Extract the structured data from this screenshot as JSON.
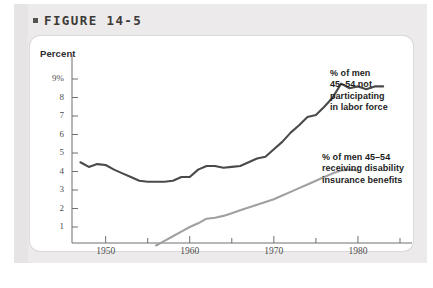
{
  "figure": {
    "bullet": "square-bullet",
    "label": "FIGURE 14-5"
  },
  "chart_data": {
    "type": "line",
    "title": "FIGURE 14-5",
    "xlabel": "",
    "ylabel": "Percent",
    "ylabel_text": "Percent",
    "xlim": [
      1946,
      1985
    ],
    "ylim": [
      0,
      9.6
    ],
    "grid": false,
    "legend_position": "right-inline",
    "y_ticks": [
      1,
      2,
      3,
      4,
      5,
      6,
      7,
      8,
      9
    ],
    "y_tick_labels": [
      "1",
      "2",
      "3",
      "4",
      "5",
      "6",
      "7",
      "8",
      "9%"
    ],
    "x_ticks": [
      1950,
      1960,
      1970,
      1980
    ],
    "x_tick_labels": [
      "1950",
      "1960",
      "1970",
      "1980"
    ],
    "x_minor_ticks": [
      1955,
      1965,
      1975,
      1985
    ],
    "colors": {
      "series1": "#4a4a4a",
      "series2": "#a0a0a0",
      "axis": "#6f6f6f",
      "card": "#ffffff",
      "panel": "#eceaea"
    },
    "series": [
      {
        "name": "% of men 45–54 not participating in labor force",
        "color": "#4a4a4a",
        "label_lines": [
          "% of men",
          "45–54 not",
          "participating",
          "in labor force"
        ],
        "x": [
          1947,
          1948,
          1949,
          1950,
          1951,
          1952,
          1953,
          1954,
          1955,
          1956,
          1957,
          1958,
          1959,
          1960,
          1961,
          1962,
          1963,
          1964,
          1965,
          1966,
          1967,
          1968,
          1969,
          1970,
          1971,
          1972,
          1973,
          1974,
          1975,
          1976,
          1977,
          1978,
          1979,
          1980,
          1981,
          1982,
          1983
        ],
        "values": [
          4.5,
          4.25,
          4.4,
          4.35,
          4.1,
          3.9,
          3.7,
          3.5,
          3.45,
          3.45,
          3.45,
          3.5,
          3.7,
          3.7,
          4.1,
          4.3,
          4.3,
          4.2,
          4.25,
          4.3,
          4.5,
          4.7,
          4.8,
          5.2,
          5.6,
          6.1,
          6.5,
          6.95,
          7.05,
          7.5,
          8.0,
          8.75,
          8.5,
          8.6,
          8.45,
          8.6,
          8.6
        ]
      },
      {
        "name": "% of men 45–54 receiving disability insurance benefits",
        "color": "#a0a0a0",
        "label_lines": [
          "% of men 45–54",
          "receiving disability",
          "insurance benefits"
        ],
        "x": [
          1956,
          1957,
          1958,
          1959,
          1960,
          1961,
          1962,
          1963,
          1964,
          1965,
          1966,
          1967,
          1968,
          1969,
          1970,
          1971,
          1972,
          1973,
          1974,
          1975,
          1976,
          1977,
          1978,
          1979,
          1980
        ],
        "values": [
          0.0,
          0.25,
          0.5,
          0.75,
          1.0,
          1.2,
          1.45,
          1.5,
          1.6,
          1.75,
          1.9,
          2.05,
          2.2,
          2.35,
          2.5,
          2.7,
          2.9,
          3.1,
          3.3,
          3.5,
          3.7,
          3.9,
          4.05,
          4.1,
          4.05
        ]
      }
    ]
  }
}
